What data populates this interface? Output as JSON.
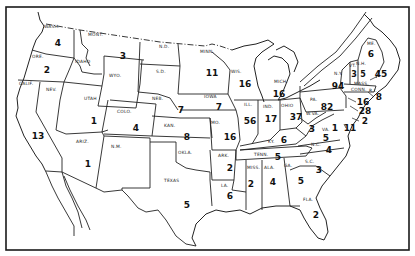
{
  "map": {
    "type": "choropleth-count",
    "region": "United States (48 contiguous states)",
    "states": [
      {
        "abbr": "WASH.",
        "value": "4",
        "lx": 44,
        "ly": 28,
        "vx": 58,
        "vy": 46
      },
      {
        "abbr": "ORE.",
        "value": "2",
        "lx": 32,
        "ly": 57,
        "vx": 47,
        "vy": 73
      },
      {
        "abbr": "CALIF.",
        "value": "13",
        "lx": 20,
        "ly": 84,
        "vx": 38,
        "vy": 139
      },
      {
        "abbr": "NEV.",
        "value": "",
        "lx": 46,
        "ly": 90,
        "vx": 0,
        "vy": 0
      },
      {
        "abbr": "IDAHO",
        "value": "",
        "lx": 75,
        "ly": 63,
        "vx": 0,
        "vy": 0
      },
      {
        "abbr": "MONT.",
        "value": "3",
        "lx": 88,
        "ly": 35,
        "vx": 123,
        "vy": 59
      },
      {
        "abbr": "WYO.",
        "value": "",
        "lx": 108,
        "ly": 76,
        "vx": 0,
        "vy": 0
      },
      {
        "abbr": "UTAH",
        "value": "1",
        "lx": 85,
        "ly": 99,
        "vx": 94,
        "vy": 123
      },
      {
        "abbr": "COLO.",
        "value": "4",
        "lx": 117,
        "ly": 113,
        "vx": 136,
        "vy": 131
      },
      {
        "abbr": "ARIZ.",
        "value": "1",
        "lx": 76,
        "ly": 143,
        "vx": 88,
        "vy": 167
      },
      {
        "abbr": "N.M.",
        "value": "",
        "lx": 111,
        "ly": 147,
        "vx": 0,
        "vy": 0
      },
      {
        "abbr": "N.D.",
        "value": "",
        "lx": 159,
        "ly": 47,
        "vx": 0,
        "vy": 0
      },
      {
        "abbr": "S.D.",
        "value": "",
        "lx": 157,
        "ly": 72,
        "vx": 0,
        "vy": 0
      },
      {
        "abbr": "NEB.",
        "value": "7",
        "lx": 153,
        "ly": 99,
        "vx": 181,
        "vy": 113
      },
      {
        "abbr": "KAN.",
        "value": "8",
        "lx": 165,
        "ly": 127,
        "vx": 187,
        "vy": 140
      },
      {
        "abbr": "OKLA.",
        "value": "",
        "lx": 178,
        "ly": 153,
        "vx": 0,
        "vy": 0
      },
      {
        "abbr": "TEXAS",
        "value": "5",
        "lx": 163,
        "ly": 182,
        "vx": 187,
        "vy": 208
      },
      {
        "abbr": "MINN.",
        "value": "11",
        "lx": 200,
        "ly": 52,
        "vx": 212,
        "vy": 76
      },
      {
        "abbr": "IOWA",
        "value": "7",
        "lx": 204,
        "ly": 97,
        "vx": 219,
        "vy": 110
      },
      {
        "abbr": "MO.",
        "value": "16",
        "lx": 209,
        "ly": 124,
        "vx": 230,
        "vy": 139
      },
      {
        "abbr": "ARK.",
        "value": "2",
        "lx": 218,
        "ly": 156,
        "vx": 230,
        "vy": 170
      },
      {
        "abbr": "LA.",
        "value": "6",
        "lx": 220,
        "ly": 186,
        "vx": 230,
        "vy": 198
      },
      {
        "abbr": "WIS.",
        "value": "16",
        "lx": 231,
        "ly": 72,
        "vx": 245,
        "vy": 86
      },
      {
        "abbr": "ILL.",
        "value": "56",
        "lx": 244,
        "ly": 105,
        "vx": 250,
        "vy": 123
      },
      {
        "abbr": "MICH.",
        "value": "16",
        "lx": 275,
        "ly": 82,
        "vx": 279,
        "vy": 96
      },
      {
        "abbr": "IND.",
        "value": "17",
        "lx": 264,
        "ly": 108,
        "vx": 271,
        "vy": 121
      },
      {
        "abbr": "OHIO",
        "value": "37",
        "lx": 281,
        "ly": 107,
        "vx": 296,
        "vy": 119
      },
      {
        "abbr": "KY.",
        "value": "6",
        "lx": 268,
        "ly": 143,
        "vx": 284,
        "vy": 142
      },
      {
        "abbr": "TENN.",
        "value": "5",
        "lx": 256,
        "ly": 156,
        "vx": 278,
        "vy": 159
      },
      {
        "abbr": "MISS.",
        "value": "2",
        "lx": 247,
        "ly": 168,
        "vx": 251,
        "vy": 186
      },
      {
        "abbr": "ALA.",
        "value": "4",
        "lx": 265,
        "ly": 168,
        "vx": 273,
        "vy": 184
      },
      {
        "abbr": "GA.",
        "value": "5",
        "lx": 284,
        "ly": 167,
        "vx": 301,
        "vy": 183
      },
      {
        "abbr": "FLA.",
        "value": "2",
        "lx": 303,
        "ly": 200,
        "vx": 316,
        "vy": 217
      },
      {
        "abbr": "S.C.",
        "value": "3",
        "lx": 305,
        "ly": 162,
        "vx": 319,
        "vy": 172
      },
      {
        "abbr": "N.C.",
        "value": "4",
        "lx": 311,
        "ly": 145,
        "vx": 329,
        "vy": 152
      },
      {
        "abbr": "VA.",
        "value": "5",
        "lx": 322,
        "ly": 130,
        "vx": 326,
        "vy": 140
      },
      {
        "abbr": "W.VA.",
        "value": "3",
        "lx": 307,
        "ly": 114,
        "vx": 312,
        "vy": 131
      },
      {
        "abbr": "PA.",
        "value": "82",
        "lx": 310,
        "ly": 100,
        "vx": 327,
        "vy": 109
      },
      {
        "abbr": "N.Y.",
        "value": "94",
        "lx": 335,
        "ly": 74,
        "vx": 338,
        "vy": 88
      },
      {
        "abbr": "VT.",
        "value": "3",
        "lx": 349,
        "ly": 66,
        "vx": 353,
        "vy": 76
      },
      {
        "abbr": "N.H.",
        "value": "5",
        "lx": 357,
        "ly": 64,
        "vx": 363,
        "vy": 75
      },
      {
        "abbr": "ME.",
        "value": "6",
        "lx": 367,
        "ly": 44,
        "vx": 371,
        "vy": 56
      },
      {
        "abbr": "MASS.",
        "value": "45",
        "lx": 354,
        "ly": 84,
        "vx": 380,
        "vy": 76
      },
      {
        "abbr": "CONN.",
        "value": "",
        "lx": 352,
        "ly": 92,
        "vx": 0,
        "vy": 0
      },
      {
        "abbr": "R.I.",
        "value": "8",
        "lx": 371,
        "ly": 92,
        "vx": 379,
        "vy": 99
      },
      {
        "abbr": "N.J.",
        "value": "16",
        "lx": 0,
        "ly": 0,
        "vx": 362,
        "vy": 104
      },
      {
        "abbr": "DEL.",
        "value": "28",
        "lx": 0,
        "ly": 0,
        "vx": 365,
        "vy": 113
      },
      {
        "abbr": "MD.",
        "value": "1",
        "lx": 0,
        "ly": 0,
        "vx": 333,
        "vy": 130
      },
      {
        "abbr": "D.C.",
        "value": "11",
        "lx": 0,
        "ly": 0,
        "vx": 350,
        "vy": 130
      },
      {
        "abbr": "MD-E",
        "value": "2",
        "lx": 0,
        "ly": 0,
        "vx": 365,
        "vy": 122
      }
    ]
  },
  "labels": {
    "wash": "WASH.",
    "ore": "ORE.",
    "calif": "CALIF.",
    "nev": "NEV.",
    "idaho": "IDAHO",
    "mont": "MONT.",
    "wyo": "WYO.",
    "utah": "UTAH",
    "colo": "COLO.",
    "ariz": "ARIZ.",
    "nm": "N.M.",
    "nd": "N.D.",
    "sd": "S.D.",
    "neb": "NEB.",
    "kan": "KAN.",
    "okla": "OKLA.",
    "texas": "TEXAS",
    "minn": "MINN.",
    "iowa": "IOWA",
    "mo": "MO.",
    "ark": "ARK.",
    "la": "LA.",
    "wis": "WIS.",
    "ill": "ILL.",
    "mich": "MICH.",
    "ind": "IND.",
    "ohio": "OHIO",
    "ky": "KY.",
    "tenn": "TENN.",
    "miss": "MISS.",
    "ala": "ALA.",
    "ga": "GA.",
    "fla": "FLA.",
    "sc": "S.C.",
    "nc": "N.C.",
    "va": "VA.",
    "wva": "W.VA.",
    "pa": "PA.",
    "ny": "N.Y.",
    "vt": "VT.",
    "nh": "N.H.",
    "me": "ME.",
    "mass": "MASS.",
    "conn": "CONN.",
    "ri": "R.I."
  },
  "values": {
    "wash": "4",
    "ore": "2",
    "calif": "13",
    "mont": "3",
    "utah": "1",
    "colo": "4",
    "ariz": "1",
    "neb": "7",
    "kan": "8",
    "texas": "5",
    "minn": "11",
    "iowa": "7",
    "mo": "16",
    "ark": "2",
    "la": "6",
    "wis": "16",
    "ill": "56",
    "mich": "16",
    "ind": "17",
    "ohio": "37",
    "ky": "6",
    "tenn": "5",
    "miss": "2",
    "ala": "4",
    "ga": "5",
    "fla": "2",
    "sc": "3",
    "nc": "4",
    "va": "5",
    "wva": "3",
    "pa": "82",
    "ny": "94",
    "vt": "3",
    "nh": "5",
    "me": "6",
    "mass": "45",
    "ri": "8",
    "nj": "16",
    "del": "28",
    "md": "1",
    "dc": "11",
    "md_east": "2"
  }
}
